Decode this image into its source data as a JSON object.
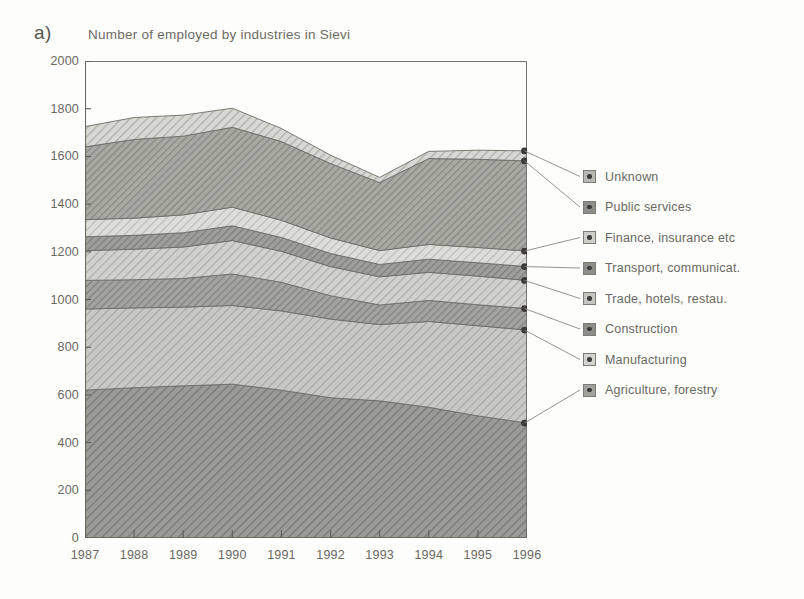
{
  "panel": {
    "label": "a)"
  },
  "chart_data": {
    "type": "area",
    "stacked": true,
    "title": "Number of employed by industries in Sievi",
    "xlabel": "",
    "ylabel": "",
    "ylim": [
      0,
      2000
    ],
    "ytick_step": 200,
    "yticks": [
      "2000",
      "1800",
      "1600",
      "1400",
      "1200",
      "1000",
      "800",
      "600",
      "400",
      "200",
      "0"
    ],
    "grid": false,
    "legend_position": "right",
    "categories": [
      "1987",
      "1988",
      "1989",
      "1990",
      "1991",
      "1992",
      "1993",
      "1994",
      "1995",
      "1996"
    ],
    "x": [
      1987,
      1988,
      1989,
      1990,
      1991,
      1992,
      1993,
      1994,
      1995,
      1996
    ],
    "series": [
      {
        "name": "Agriculture, forestry",
        "values": [
          620,
          630,
          638,
          645,
          620,
          588,
          575,
          548,
          512,
          482
        ]
      },
      {
        "name": "Manufacturing",
        "values": [
          340,
          335,
          330,
          330,
          332,
          330,
          320,
          360,
          378,
          390
        ]
      },
      {
        "name": "Construction",
        "values": [
          120,
          118,
          120,
          132,
          120,
          98,
          82,
          88,
          88,
          90
        ]
      },
      {
        "name": "Trade, hotels, restau.",
        "values": [
          125,
          128,
          132,
          140,
          130,
          122,
          118,
          118,
          120,
          118
        ]
      },
      {
        "name": "Transport, communicat.",
        "values": [
          58,
          58,
          60,
          62,
          58,
          55,
          52,
          55,
          56,
          58
        ]
      },
      {
        "name": "Finance, insurance etc",
        "values": [
          72,
          72,
          75,
          78,
          72,
          65,
          58,
          62,
          64,
          65
        ]
      },
      {
        "name": "Public services",
        "values": [
          305,
          330,
          330,
          335,
          330,
          312,
          285,
          360,
          370,
          378
        ]
      },
      {
        "name": "Unknown",
        "values": [
          85,
          92,
          88,
          80,
          55,
          35,
          22,
          30,
          38,
          42
        ]
      }
    ],
    "totals_note": ""
  },
  "legend": {
    "items": [
      {
        "label": "Unknown",
        "swatch_fill": "#b9b9b4"
      },
      {
        "label": "Public services",
        "swatch_fill": "#8e8e89"
      },
      {
        "label": "Finance, insurance etc",
        "swatch_fill": "#cfcfca"
      },
      {
        "label": "Transport, communicat.",
        "swatch_fill": "#8e8e89"
      },
      {
        "label": "Trade, hotels, restau.",
        "swatch_fill": "#c6c6c1"
      },
      {
        "label": "Construction",
        "swatch_fill": "#8e8e89"
      },
      {
        "label": "Manufacturing",
        "swatch_fill": "#d4d4cf"
      },
      {
        "label": "Agriculture, forestry",
        "swatch_fill": "#a2a29d"
      }
    ]
  },
  "colors": {
    "background": "#fdfdfc",
    "axis": "#6a6862",
    "text": "#6a6862",
    "marker": "#3b3a37"
  }
}
